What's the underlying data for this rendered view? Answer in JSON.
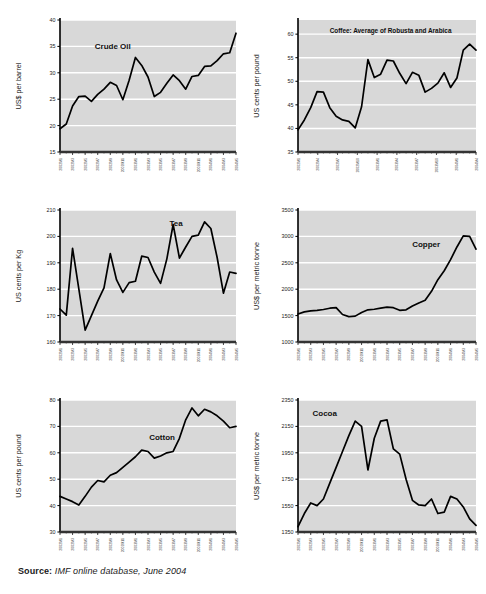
{
  "figure": {
    "top_title": "",
    "source_prefix": "Source:",
    "source_text": " IMF online database, June 2004",
    "plot_bg": "#d8d8d8",
    "grid_color": "#ffffff",
    "line_color": "#000000",
    "axis_color": "#000000"
  },
  "chart_data": [
    {
      "type": "line",
      "id": "crude-oil",
      "title": "",
      "series_label": "Crude Oil",
      "xlabel": "",
      "ylabel": "US$ per barrel",
      "ylim": [
        15,
        40
      ],
      "yticks": [
        15,
        20,
        25,
        30,
        35,
        40
      ],
      "grid": true,
      "legend": "inline-label",
      "x": [
        "2002M1",
        "2002M2",
        "2002M3",
        "2002M4",
        "2002M5",
        "2002M6",
        "2002M7",
        "2002M8",
        "2002M9",
        "2002M10",
        "2002M11",
        "2002M12",
        "2003M1",
        "2003M2",
        "2003M3",
        "2003M4",
        "2003M5",
        "2003M6",
        "2003M7",
        "2003M8",
        "2003M9",
        "2003M10",
        "2003M11",
        "2003M12",
        "2004M1",
        "2004M2",
        "2004M3",
        "2004M4",
        "2004M5"
      ],
      "xtick_labels": [
        "2002M1",
        "2002M3",
        "2002M5",
        "2002M7",
        "2002M9",
        "2002M11",
        "2003M1",
        "2003M3",
        "2003M5",
        "2003M7",
        "2003M9",
        "2003M11",
        "2004M1",
        "2004M3",
        "2004M5"
      ],
      "values": [
        19.4,
        20.3,
        23.7,
        25.5,
        25.6,
        24.6,
        25.9,
        26.9,
        28.2,
        27.6,
        24.9,
        28.6,
        32.9,
        31.4,
        29.2,
        25.5,
        26.3,
        28.0,
        29.6,
        28.5,
        26.9,
        29.3,
        29.5,
        31.2,
        31.3,
        32.3,
        33.6,
        33.8,
        37.5
      ]
    },
    {
      "type": "line",
      "id": "coffee",
      "title": "Coffee: Average of Robusta and Arabica",
      "series_label": "",
      "xlabel": "",
      "ylabel": "US cents per pound",
      "ylim": [
        35,
        63
      ],
      "yticks": [
        35,
        40,
        45,
        50,
        55,
        60
      ],
      "grid": true,
      "legend": "panel-title",
      "x": [
        "2002M1",
        "2002M2",
        "2002M3",
        "2002M4",
        "2002M5",
        "2002M6",
        "2002M7",
        "2002M8",
        "2002M9",
        "2002M10",
        "2002M11",
        "2002M12",
        "2003M1",
        "2003M2",
        "2003M3",
        "2003M4",
        "2003M5",
        "2003M6",
        "2003M7",
        "2003M8",
        "2003M9",
        "2003M10",
        "2003M11",
        "2003M12",
        "2004M1",
        "2004M2",
        "2004M3",
        "2004M4",
        "2004M5"
      ],
      "xtick_labels": [
        "2002M1",
        "2002M4",
        "2002M7",
        "2002M10",
        "2003M1",
        "2003M4",
        "2003M7",
        "2003M10",
        "2004M1",
        "2004M4"
      ],
      "values": [
        39.7,
        41.8,
        44.4,
        47.8,
        47.7,
        44.4,
        42.6,
        41.8,
        41.5,
        40.1,
        44.6,
        54.6,
        50.8,
        51.5,
        54.5,
        54.3,
        51.7,
        49.5,
        51.9,
        51.3,
        47.7,
        48.5,
        49.6,
        51.8,
        48.7,
        50.7,
        56.6,
        57.9,
        56.6
      ]
    },
    {
      "type": "line",
      "id": "tea",
      "title": "",
      "series_label": "Tea",
      "xlabel": "",
      "ylabel": "US cents per Kg",
      "ylim": [
        160,
        210
      ],
      "yticks": [
        160,
        170,
        180,
        190,
        200,
        210
      ],
      "grid": true,
      "legend": "inline-label",
      "x": [
        "2002M1",
        "2002M2",
        "2002M3",
        "2002M4",
        "2002M5",
        "2002M6",
        "2002M7",
        "2002M8",
        "2002M9",
        "2002M10",
        "2002M11",
        "2002M12",
        "2003M1",
        "2003M2",
        "2003M3",
        "2003M4",
        "2003M5",
        "2003M6",
        "2003M7",
        "2003M8",
        "2003M9",
        "2003M10",
        "2003M11",
        "2003M12",
        "2004M1",
        "2004M2",
        "2004M3",
        "2004M4",
        "2004M5"
      ],
      "xtick_labels": [
        "2002M1",
        "2002M3",
        "2002M5",
        "2002M7",
        "2002M9",
        "2002M11",
        "2003M1",
        "2003M3",
        "2003M5",
        "2003M7",
        "2003M9",
        "2003M11",
        "2004M1",
        "2004M3",
        "2004M5"
      ],
      "values": [
        172.5,
        170.2,
        195.5,
        180.0,
        164.5,
        170.0,
        175.5,
        180.5,
        193.5,
        183.5,
        178.8,
        182.5,
        183.0,
        192.5,
        192.0,
        186.5,
        182.2,
        191.5,
        204.5,
        191.8,
        196.0,
        200.0,
        200.5,
        205.5,
        203.0,
        192.0,
        178.5,
        186.5,
        186.0
      ]
    },
    {
      "type": "line",
      "id": "copper",
      "title": "",
      "series_label": "Copper",
      "xlabel": "",
      "ylabel": "US$ per metric tonne",
      "ylim": [
        1000,
        3500
      ],
      "yticks": [
        1000,
        1500,
        2000,
        2500,
        3000,
        3500
      ],
      "grid": true,
      "legend": "inline-label",
      "x": [
        "2002M1",
        "2002M2",
        "2002M3",
        "2002M4",
        "2002M5",
        "2002M6",
        "2002M7",
        "2002M8",
        "2002M9",
        "2002M10",
        "2002M11",
        "2002M12",
        "2003M1",
        "2003M2",
        "2003M3",
        "2003M4",
        "2003M5",
        "2003M6",
        "2003M7",
        "2003M8",
        "2003M9",
        "2003M10",
        "2003M11",
        "2003M12",
        "2004M1",
        "2004M2",
        "2004M3",
        "2004M4",
        "2004M5"
      ],
      "xtick_labels": [
        "2002M1",
        "2002M3",
        "2002M5",
        "2002M7",
        "2002M9",
        "2002M11",
        "2003M1",
        "2003M3",
        "2003M5",
        "2003M7",
        "2003M9",
        "2003M11",
        "2004M1",
        "2004M3",
        "2004M5"
      ],
      "values": [
        1530,
        1570,
        1590,
        1600,
        1615,
        1640,
        1650,
        1520,
        1480,
        1490,
        1560,
        1610,
        1620,
        1640,
        1660,
        1650,
        1600,
        1610,
        1680,
        1740,
        1790,
        1960,
        2180,
        2350,
        2560,
        2800,
        3010,
        3000,
        2760
      ]
    },
    {
      "type": "line",
      "id": "cotton",
      "title": "",
      "series_label": "Cotton",
      "xlabel": "",
      "ylabel": "US cents per pound",
      "ylim": [
        30,
        80
      ],
      "yticks": [
        30,
        40,
        50,
        60,
        70,
        80
      ],
      "grid": true,
      "legend": "inline-label",
      "x": [
        "2002M1",
        "2002M2",
        "2002M3",
        "2002M4",
        "2002M5",
        "2002M6",
        "2002M7",
        "2002M8",
        "2002M9",
        "2002M10",
        "2002M11",
        "2002M12",
        "2003M1",
        "2003M2",
        "2003M3",
        "2003M4",
        "2003M5",
        "2003M6",
        "2003M7",
        "2003M8",
        "2003M9",
        "2003M10",
        "2003M11",
        "2003M12",
        "2004M1",
        "2004M2",
        "2004M3",
        "2004M4",
        "2004M5"
      ],
      "xtick_labels": [
        "2002M1",
        "2002M3",
        "2002M5",
        "2002M7",
        "2002M9",
        "2002M11",
        "2003M1",
        "2003M3",
        "2003M5",
        "2003M7",
        "2003M9",
        "2003M11",
        "2004M1",
        "2004M3",
        "2004M5"
      ],
      "values": [
        43.5,
        42.5,
        41.5,
        40.2,
        43.5,
        47.0,
        49.5,
        49.0,
        51.5,
        52.5,
        54.5,
        56.5,
        58.5,
        61.0,
        60.5,
        58.0,
        58.8,
        60.0,
        60.5,
        65.5,
        72.5,
        77.0,
        74.0,
        76.5,
        75.5,
        74.0,
        72.0,
        69.5,
        70.0
      ]
    },
    {
      "type": "line",
      "id": "cocoa",
      "title": "",
      "series_label": "Cocoa",
      "xlabel": "",
      "ylabel": "US$ per metric tonne",
      "ylim": [
        1350,
        2350
      ],
      "yticks": [
        1350,
        1550,
        1750,
        1950,
        2150,
        2350
      ],
      "grid": true,
      "legend": "inline-label",
      "x": [
        "2002M1",
        "2002M2",
        "2002M3",
        "2002M4",
        "2002M5",
        "2002M6",
        "2002M7",
        "2002M8",
        "2002M9",
        "2002M10",
        "2002M11",
        "2002M12",
        "2003M1",
        "2003M2",
        "2003M3",
        "2003M4",
        "2003M5",
        "2003M6",
        "2003M7",
        "2003M8",
        "2003M9",
        "2003M10",
        "2003M11",
        "2003M12",
        "2004M1",
        "2004M2",
        "2004M3",
        "2004M4",
        "2004M5"
      ],
      "xtick_labels": [
        "2002M1",
        "2002M3",
        "2002M5",
        "2002M7",
        "2002M9",
        "2002M11",
        "2003M1",
        "2003M3",
        "2003M5",
        "2003M7",
        "2003M9",
        "2003M11",
        "2004M1",
        "2004M3",
        "2004M5"
      ],
      "values": [
        1390,
        1490,
        1570,
        1550,
        1600,
        1720,
        1840,
        1960,
        2080,
        2190,
        2150,
        1820,
        2060,
        2190,
        2200,
        1980,
        1940,
        1750,
        1590,
        1555,
        1550,
        1600,
        1490,
        1500,
        1620,
        1600,
        1540,
        1450,
        1400
      ]
    }
  ],
  "panels": [
    {
      "id": "crude-oil",
      "x": 8,
      "y": 10,
      "w": 238,
      "h": 190
    },
    {
      "id": "coffee",
      "x": 246,
      "y": 10,
      "w": 240,
      "h": 190
    },
    {
      "id": "tea",
      "x": 8,
      "y": 200,
      "w": 238,
      "h": 190
    },
    {
      "id": "copper",
      "x": 246,
      "y": 200,
      "w": 240,
      "h": 190
    },
    {
      "id": "cotton",
      "x": 8,
      "y": 390,
      "w": 238,
      "h": 190
    },
    {
      "id": "cocoa",
      "x": 246,
      "y": 390,
      "w": 240,
      "h": 190
    }
  ]
}
